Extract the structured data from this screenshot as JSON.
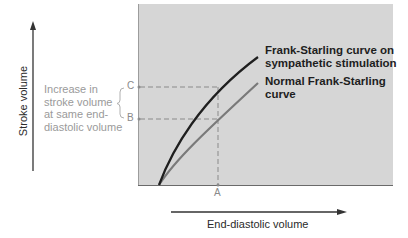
{
  "diagram": {
    "y_axis_label": "Stroke volume",
    "x_axis_label": "End-diastolic volume",
    "tick_labels": {
      "A": "A",
      "B": "B",
      "C": "C"
    },
    "annotation": {
      "lines": [
        "Increase in",
        "stroke volume",
        "at same end-",
        "diastolic volume"
      ]
    },
    "curves": [
      {
        "name": "sympathetic",
        "label_lines": [
          "Frank-Starling curve on",
          "sympathetic stimulation"
        ],
        "color": "#1f1f1f"
      },
      {
        "name": "normal",
        "label_lines": [
          "Normal Frank-Starling",
          "curve"
        ],
        "color": "#7a7a7a"
      }
    ],
    "colors": {
      "plot_background": "#d6d6d6",
      "dashed_guides": "#8a8a8a"
    }
  }
}
